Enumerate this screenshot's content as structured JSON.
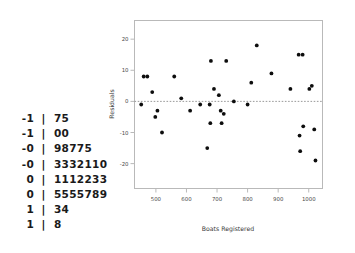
{
  "stem_leaf": {
    "name": "stem-and-leaf-plot",
    "separator": "|",
    "rows": [
      {
        "stem": "-1",
        "leaf": "75"
      },
      {
        "stem": "-1",
        "leaf": "00"
      },
      {
        "stem": "-0",
        "leaf": "98775"
      },
      {
        "stem": "-0",
        "leaf": "3332110"
      },
      {
        "stem": "0",
        "leaf": "1112233"
      },
      {
        "stem": "0",
        "leaf": "5555789"
      },
      {
        "stem": "1",
        "leaf": "34"
      },
      {
        "stem": "1",
        "leaf": "8"
      }
    ]
  },
  "chart_data": {
    "type": "scatter",
    "title": "",
    "xlabel": "Boats Registered",
    "ylabel": "Residuals",
    "xlim": [
      430,
      1045
    ],
    "ylim": [
      -28,
      26
    ],
    "xticks": [
      500,
      600,
      700,
      800,
      900,
      1000
    ],
    "yticks": [
      -20,
      -10,
      0,
      10,
      20
    ],
    "grid": false,
    "legend": "none",
    "reference_line": {
      "y": 0,
      "style": "dotted"
    },
    "x": [
      452,
      460,
      472,
      488,
      498,
      505,
      520,
      560,
      583,
      612,
      645,
      668,
      676,
      678,
      680,
      690,
      706,
      712,
      715,
      722,
      730,
      755,
      800,
      812,
      830,
      878,
      940,
      967,
      970,
      972,
      980,
      982,
      1002,
      1010,
      1018,
      1022
    ],
    "y": [
      -1,
      8,
      8,
      3,
      -5,
      -3,
      -10,
      8,
      1,
      -3,
      -1,
      -15,
      -1,
      -7,
      13,
      4,
      2,
      -3,
      -7,
      -4,
      13,
      0,
      -1,
      6,
      18,
      9,
      4,
      15,
      -11,
      -16,
      15,
      -8,
      4,
      5,
      -9,
      -19
    ],
    "marker": "filled-circle",
    "marker_color": "#0d0d0d"
  }
}
